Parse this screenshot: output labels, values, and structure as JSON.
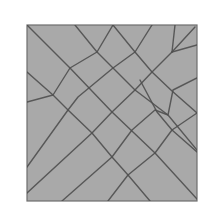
{
  "diagram": {
    "type": "crease-pattern",
    "colors": {
      "background": "#ffffff",
      "panel_fill": "#a9a9a9",
      "panel_border": "#6e6e6e",
      "line": "#4f4f4f"
    },
    "panel": {
      "x": 27,
      "y": 25,
      "width": 170,
      "height": 176
    },
    "lines": [
      {
        "name": "descending-main-diagonal",
        "points": [
          [
            27,
            25
          ],
          [
            70,
            68
          ],
          [
            112,
            112
          ],
          [
            155,
            153
          ],
          [
            197,
            199
          ]
        ]
      },
      {
        "name": "descending-2",
        "points": [
          [
            75,
            25
          ],
          [
            97,
            52
          ],
          [
            135,
            90
          ],
          [
            168,
            115
          ],
          [
            197,
            150
          ]
        ]
      },
      {
        "name": "descending-3",
        "points": [
          [
            113,
            25
          ],
          [
            135,
            52
          ],
          [
            152,
            72
          ],
          [
            172,
            91
          ],
          [
            197,
            113
          ]
        ]
      },
      {
        "name": "descending-4",
        "points": [
          [
            27,
            72
          ],
          [
            53,
            95
          ],
          [
            68,
            110
          ],
          [
            92,
            133
          ],
          [
            112,
            157
          ],
          [
            128,
            175
          ],
          [
            150,
            201
          ]
        ]
      },
      {
        "name": "descending-5",
        "points": [
          [
            140,
            80
          ],
          [
            157,
            112
          ],
          [
            172,
            130
          ],
          [
            197,
            152
          ]
        ]
      },
      {
        "name": "ascending-1",
        "points": [
          [
            27,
            102
          ],
          [
            53,
            95
          ],
          [
            70,
            68
          ],
          [
            97,
            52
          ],
          [
            113,
            25
          ]
        ]
      },
      {
        "name": "ascending-2",
        "points": [
          [
            27,
            167
          ],
          [
            68,
            110
          ],
          [
            78,
            97
          ],
          [
            113,
            68
          ],
          [
            135,
            52
          ],
          [
            152,
            25
          ]
        ]
      },
      {
        "name": "ascending-3",
        "points": [
          [
            27,
            193
          ],
          [
            92,
            133
          ],
          [
            112,
            112
          ],
          [
            135,
            90
          ],
          [
            152,
            72
          ],
          [
            172,
            52
          ],
          [
            175,
            25
          ]
        ]
      },
      {
        "name": "ascending-4",
        "points": [
          [
            62,
            201
          ],
          [
            112,
            157
          ],
          [
            132,
            130
          ],
          [
            155,
            110
          ],
          [
            168,
            115
          ],
          [
            173,
            90
          ],
          [
            197,
            78
          ]
        ]
      },
      {
        "name": "ascending-5",
        "points": [
          [
            108,
            201
          ],
          [
            128,
            175
          ],
          [
            155,
            153
          ],
          [
            172,
            130
          ],
          [
            197,
            113
          ]
        ]
      },
      {
        "name": "top-right-fan-1",
        "points": [
          [
            172,
            52
          ],
          [
            197,
            45
          ]
        ]
      },
      {
        "name": "top-right-fan-2",
        "points": [
          [
            172,
            52
          ],
          [
            195,
            27
          ]
        ]
      }
    ]
  }
}
